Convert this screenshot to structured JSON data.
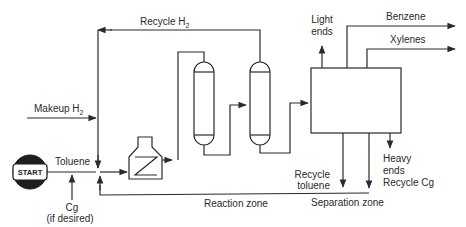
{
  "diagram": {
    "type": "process-flow",
    "colors": {
      "line": "#2a2a2a",
      "background": "#ffffff"
    },
    "nodes": {
      "start": {
        "label": "START"
      },
      "furnace": {
        "label": ""
      },
      "reactor_1": {
        "label": ""
      },
      "reactor_2": {
        "label": ""
      },
      "separator": {
        "label": ""
      }
    },
    "streams": {
      "recycle_h2": {
        "label": "Recycle H",
        "sub": "2"
      },
      "makeup_h2": {
        "label": "Makeup H",
        "sub": "2"
      },
      "toluene": {
        "label": "Toluene"
      },
      "cg": {
        "label": "Cg"
      },
      "cg_note": {
        "label": "(if desired)"
      },
      "light_ends": {
        "line1": "Light",
        "line2": "ends"
      },
      "benzene": {
        "label": "Benzene"
      },
      "xylenes": {
        "label": "Xylenes"
      },
      "recycle_toluene": {
        "line1": "Recycle",
        "line2": "toluene"
      },
      "heavy_ends": {
        "line1": "Heavy",
        "line2": "ends",
        "line3": "Recycle Cg"
      }
    },
    "zones": {
      "reaction": {
        "label": "Reaction zone"
      },
      "separation": {
        "label": "Separation zone"
      }
    }
  }
}
